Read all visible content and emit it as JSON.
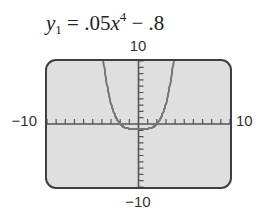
{
  "equation": {
    "lhs_var": "y",
    "lhs_sub": "1",
    "equals": "=",
    "coef": ".05",
    "var": "x",
    "exp": "4",
    "minus": "−",
    "const": ".8",
    "full_text": "y1 = .05x^4 − .8"
  },
  "window_labels": {
    "ymax": "10",
    "ymin": "−10",
    "xmin": "−10",
    "xmax": "10"
  },
  "colors": {
    "screen_bg": "#dfdfdf",
    "border": "#3f3f3f",
    "axis": "#555555",
    "curve": "#777777"
  },
  "chart_data": {
    "type": "line",
    "function": "0.05*x^4 - 0.8",
    "xlabel": "",
    "ylabel": "",
    "xlim": [
      -10,
      10
    ],
    "ylim": [
      -10,
      10
    ],
    "xscale": 1,
    "yscale": 1,
    "grid": false,
    "axis_ticks": true,
    "tick_labels": {
      "top": "10",
      "bottom": "−10",
      "left": "−10",
      "right": "10"
    },
    "series": [
      {
        "name": "y1",
        "x": [
          -3.83,
          -3.5,
          -3,
          -2.5,
          -2,
          -1.5,
          -1,
          -0.5,
          0,
          0.5,
          1,
          1.5,
          2,
          2.5,
          3,
          3.5,
          3.83
        ],
        "values": [
          10.0,
          6.7,
          3.25,
          1.15,
          0.0,
          -0.55,
          -0.75,
          -0.8,
          -0.8,
          -0.8,
          -0.75,
          -0.55,
          0.0,
          1.15,
          3.25,
          6.7,
          10.0
        ]
      }
    ],
    "x_intercepts": [
      -2,
      2
    ],
    "minimum": {
      "x": 0,
      "y": -0.8
    }
  }
}
